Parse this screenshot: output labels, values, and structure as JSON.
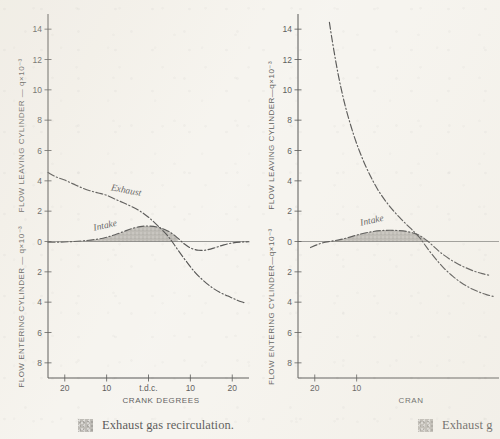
{
  "figure": {
    "background_color": "#f6f4ef",
    "ink_color": "#1f1f1f",
    "shade_color": "#a9a6a0"
  },
  "panels": [
    {
      "id": "left",
      "caption": {
        "swatch_name": "exhaust-gas-recirculation-swatch",
        "text": "Exhaust gas recirculation."
      },
      "axes": {
        "y_top_title": "FLOW LEAVING CYLINDER — q×10⁻³",
        "y_bottom_title": "FLOW ENTERING CYLINDER — q×10⁻³",
        "x_title": "CRANK DEGREES",
        "y_ticks_upper": [
          "14",
          "12",
          "10",
          "8",
          "6",
          "4",
          "2",
          "0"
        ],
        "y_ticks_lower": [
          "2",
          "4",
          "6",
          "8"
        ],
        "x_ticks": [
          "20",
          "10",
          "t.d.c.",
          "10",
          "20"
        ],
        "y_range": [
          -9,
          15
        ],
        "x_range": [
          -24,
          24
        ]
      },
      "series": [
        {
          "name": "Exhaust",
          "label": "Exhaust",
          "style": "dash-dot",
          "points": [
            [
              -24.0,
              4.55
            ],
            [
              -22.0,
              4.25
            ],
            [
              -20.0,
              4.05
            ],
            [
              -18.0,
              3.8
            ],
            [
              -16.0,
              3.55
            ],
            [
              -14.0,
              3.35
            ],
            [
              -12.0,
              3.2
            ],
            [
              -10.0,
              3.05
            ],
            [
              -8.0,
              2.8
            ],
            [
              -6.0,
              2.55
            ],
            [
              -4.0,
              2.3
            ],
            [
              -2.0,
              2.0
            ],
            [
              0.0,
              1.6
            ],
            [
              2.0,
              1.1
            ],
            [
              4.0,
              0.55
            ],
            [
              5.5,
              0.05
            ],
            [
              7.0,
              -0.55
            ],
            [
              9.0,
              -1.3
            ],
            [
              11.0,
              -2.0
            ],
            [
              13.0,
              -2.55
            ],
            [
              15.0,
              -3.0
            ],
            [
              17.0,
              -3.35
            ],
            [
              19.0,
              -3.6
            ],
            [
              21.0,
              -3.85
            ],
            [
              23.0,
              -4.05
            ]
          ]
        },
        {
          "name": "Intake",
          "label": "Intake",
          "style": "dash-dot",
          "points": [
            [
              -24.0,
              -0.05
            ],
            [
              -21.0,
              -0.04
            ],
            [
              -18.0,
              0.0
            ],
            [
              -15.0,
              0.06
            ],
            [
              -12.0,
              0.16
            ],
            [
              -10.0,
              0.28
            ],
            [
              -8.0,
              0.45
            ],
            [
              -6.0,
              0.65
            ],
            [
              -4.0,
              0.85
            ],
            [
              -2.0,
              0.98
            ],
            [
              0.0,
              1.02
            ],
            [
              2.0,
              0.96
            ],
            [
              4.0,
              0.78
            ],
            [
              5.5,
              0.55
            ],
            [
              7.0,
              0.22
            ],
            [
              8.5,
              -0.15
            ],
            [
              10.0,
              -0.42
            ],
            [
              12.0,
              -0.58
            ],
            [
              14.0,
              -0.55
            ],
            [
              16.0,
              -0.4
            ],
            [
              18.0,
              -0.22
            ],
            [
              20.0,
              -0.1
            ],
            [
              22.0,
              -0.04
            ],
            [
              24.0,
              -0.02
            ]
          ]
        }
      ],
      "shaded_region": {
        "name": "exhaust-gas-recirculation-area",
        "description": "area between intake curve and zero line"
      }
    },
    {
      "id": "right",
      "caption": {
        "swatch_name": "exhaust-gas-recirculation-swatch",
        "text": "Exhaust g"
      },
      "axes": {
        "y_top_title": "FLOW LEAVING CYLINDER—q×10⁻³",
        "y_bottom_title": "FLOW ENTERING CYLINDER—q×10⁻³",
        "x_title": "CRAN",
        "y_ticks_upper": [
          "14",
          "12",
          "10",
          "8",
          "6",
          "4",
          "2",
          "0"
        ],
        "y_ticks_lower": [
          "2",
          "4",
          "6",
          "8"
        ],
        "x_ticks": [
          "20",
          "10"
        ],
        "y_range": [
          -9,
          15
        ],
        "x_range": [
          -24,
          24
        ]
      },
      "series": [
        {
          "name": "Exhaust",
          "label": "",
          "style": "dash-dot",
          "points": [
            [
              -16.5,
              14.45
            ],
            [
              -16.0,
              13.55
            ],
            [
              -15.4,
              12.55
            ],
            [
              -14.8,
              11.6
            ],
            [
              -14.1,
              10.6
            ],
            [
              -13.3,
              9.6
            ],
            [
              -12.4,
              8.6
            ],
            [
              -11.4,
              7.65
            ],
            [
              -10.3,
              6.7
            ],
            [
              -9.1,
              5.8
            ],
            [
              -7.8,
              4.95
            ],
            [
              -6.4,
              4.15
            ],
            [
              -4.9,
              3.4
            ],
            [
              -3.3,
              2.75
            ],
            [
              -1.6,
              2.15
            ],
            [
              0.2,
              1.6
            ],
            [
              2.0,
              1.1
            ],
            [
              3.8,
              0.62
            ],
            [
              5.2,
              0.2
            ],
            [
              6.2,
              -0.18
            ],
            [
              7.6,
              -0.7
            ],
            [
              9.2,
              -1.25
            ],
            [
              11.0,
              -1.8
            ],
            [
              13.0,
              -2.3
            ],
            [
              15.0,
              -2.72
            ],
            [
              17.0,
              -3.05
            ],
            [
              19.0,
              -3.3
            ],
            [
              21.0,
              -3.5
            ],
            [
              23.0,
              -3.65
            ]
          ]
        },
        {
          "name": "Intake",
          "label": "Intake",
          "style": "dash-dot",
          "points": [
            [
              -21.0,
              -0.4
            ],
            [
              -19.5,
              -0.22
            ],
            [
              -18.0,
              -0.08
            ],
            [
              -16.0,
              0.02
            ],
            [
              -14.0,
              0.12
            ],
            [
              -12.0,
              0.26
            ],
            [
              -10.0,
              0.42
            ],
            [
              -8.0,
              0.56
            ],
            [
              -6.0,
              0.66
            ],
            [
              -4.0,
              0.72
            ],
            [
              -2.0,
              0.74
            ],
            [
              0.0,
              0.72
            ],
            [
              2.0,
              0.66
            ],
            [
              4.0,
              0.52
            ],
            [
              5.5,
              0.32
            ],
            [
              7.0,
              0.02
            ],
            [
              8.5,
              -0.35
            ],
            [
              10.0,
              -0.72
            ],
            [
              12.0,
              -1.12
            ],
            [
              14.0,
              -1.45
            ],
            [
              16.0,
              -1.72
            ],
            [
              18.0,
              -1.95
            ],
            [
              20.0,
              -2.12
            ],
            [
              22.0,
              -2.25
            ]
          ]
        }
      ],
      "shaded_region": {
        "name": "exhaust-gas-recirculation-area",
        "description": "area between intake curve and zero line"
      }
    }
  ]
}
